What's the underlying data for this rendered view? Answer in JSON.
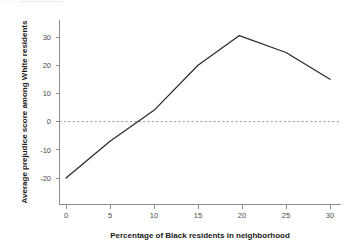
{
  "chart_data": {
    "type": "line",
    "title": "",
    "xlabel": "Percentage of Black residents in neighborhood",
    "ylabel": "Average prejudice score among White residents",
    "x": [
      0,
      5,
      10,
      15,
      19.7,
      25,
      30
    ],
    "values": [
      -20,
      -7,
      4,
      20,
      30.5,
      24.5,
      15
    ],
    "series": [
      {
        "name": "Average prejudice score",
        "x": [
          0,
          5,
          10,
          15,
          19.7,
          25,
          30
        ],
        "values": [
          -20,
          -7,
          4,
          20,
          30.5,
          24.5,
          15
        ],
        "color": "#2b2b2b"
      }
    ],
    "xlim": [
      0,
      30
    ],
    "ylim": [
      -23,
      34
    ],
    "xticks": [
      0,
      5,
      10,
      15,
      20,
      25,
      30
    ],
    "xtick_labels": [
      "0",
      "5",
      "10",
      "15",
      "20",
      "25",
      "30"
    ],
    "yticks": [
      -20,
      -10,
      0,
      10,
      20,
      30
    ],
    "ytick_labels": [
      "-20",
      "-10",
      "0",
      "10",
      "20",
      "30"
    ],
    "grid": false,
    "legend": "none",
    "annotations": [
      {
        "name": "zero-reference-line",
        "type": "hline",
        "value": 0,
        "style": "dashed",
        "color": "#9a9a9a"
      }
    ]
  },
  "axes": {
    "y_axis_title": "Average prejudice score among White residents",
    "x_axis_title": "Percentage of Black residents in neighborhood"
  },
  "colors": {
    "line": "#2b2b2b",
    "axis": "#8c8c8c",
    "zero_reference": "#9a9a9a",
    "tick_text": "#4a4a4a",
    "title_text": "#1a1a1a",
    "background": "#ffffff"
  },
  "cropped_header": {
    "fragment": "  ·        ·         · ·                                                    ——————     ·"
  }
}
